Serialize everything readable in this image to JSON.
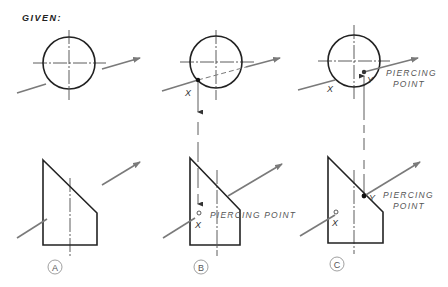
{
  "title": "GIVEN:",
  "colors": {
    "outline": "#222222",
    "arrow": "#7a7a7a",
    "centerline": "#333333",
    "text": "#555555"
  },
  "panels": [
    {
      "id": "A",
      "label": "A",
      "top_view": {
        "circle": true,
        "arrow": true
      },
      "front_view": {
        "shape": "truncated-wedge",
        "arrow": true
      },
      "annotations": []
    },
    {
      "id": "B",
      "label": "B",
      "annotations": [
        {
          "text": "X",
          "view": "top"
        },
        {
          "text": "X",
          "view": "front"
        },
        {
          "text": "PIERCING POINT",
          "view": "front"
        }
      ]
    },
    {
      "id": "C",
      "label": "C",
      "annotations": [
        {
          "text": "X",
          "view": "top"
        },
        {
          "text": "Y",
          "view": "top"
        },
        {
          "text": "PIERCING",
          "view": "top"
        },
        {
          "text": "POINT",
          "view": "top"
        },
        {
          "text": "X",
          "view": "front"
        },
        {
          "text": "Y",
          "view": "front"
        },
        {
          "text": "PIERCING",
          "view": "front"
        },
        {
          "text": "POINT",
          "view": "front"
        }
      ]
    }
  ],
  "labels": {
    "given": "GIVEN:",
    "b_top_x": "X",
    "b_front_x": "X",
    "b_front_pp": "PIERCING POINT",
    "c_top_x": "X",
    "c_top_y": "Y",
    "c_top_pp1": "PIERCING",
    "c_top_pp2": "POINT",
    "c_front_x": "X",
    "c_front_y": "Y",
    "c_front_pp1": "PIERCING",
    "c_front_pp2": "POINT",
    "circle_a": "A",
    "circle_b": "B",
    "circle_c": "C"
  }
}
